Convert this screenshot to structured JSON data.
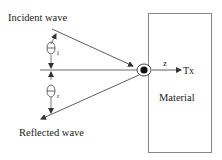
{
  "diagram": {
    "labels": {
      "incident": "Incident wave",
      "reflected": "Reflected wave",
      "material": "Material",
      "z_axis": "z",
      "tx": "Tx",
      "theta_symbol": "θ",
      "theta_i_sub": "i",
      "theta_r_sub": "r"
    },
    "colors": {
      "line": "#333333",
      "box": "#888888",
      "text": "#222222"
    }
  }
}
